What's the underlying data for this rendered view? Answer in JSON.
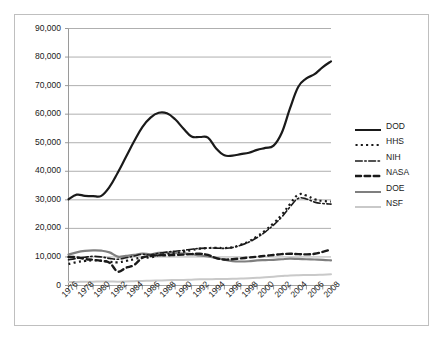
{
  "chart_data": {
    "type": "line",
    "title": "",
    "xlabel": "",
    "ylabel": "",
    "ylim": [
      0,
      90000
    ],
    "xlim": [
      1976,
      2008
    ],
    "grid": true,
    "legend_position": "right",
    "y_ticks": [
      "0",
      "10,000",
      "20,000",
      "30,000",
      "40,000",
      "50,000",
      "60,000",
      "70,000",
      "80,000",
      "90,000"
    ],
    "y_tick_values": [
      0,
      10000,
      20000,
      30000,
      40000,
      50000,
      60000,
      70000,
      80000,
      90000
    ],
    "x_tick_labels": [
      "1976",
      "1978",
      "1980",
      "1982",
      "1984",
      "1986",
      "1988",
      "1990",
      "1992",
      "1994",
      "1996",
      "1998",
      "2000",
      "2002",
      "2004",
      "2006",
      "2008"
    ],
    "x": [
      1976,
      1977,
      1978,
      1979,
      1980,
      1981,
      1982,
      1983,
      1984,
      1985,
      1986,
      1987,
      1988,
      1989,
      1990,
      1991,
      1992,
      1993,
      1994,
      1995,
      1996,
      1997,
      1998,
      1999,
      2000,
      2001,
      2002,
      2003,
      2004,
      2005,
      2006,
      2007,
      2008
    ],
    "series": [
      {
        "name": "DOD",
        "style": "solid",
        "color": "#1a1a1a",
        "width": 2.2,
        "values": [
          30200,
          31800,
          31400,
          31300,
          31400,
          34500,
          39500,
          45000,
          50500,
          55500,
          58800,
          60500,
          60300,
          58200,
          55000,
          52200,
          52000,
          51800,
          48000,
          45600,
          45500,
          46000,
          46500,
          47500,
          48200,
          49000,
          53500,
          62000,
          69500,
          72500,
          74000,
          76500,
          78500
        ]
      },
      {
        "name": "HHS",
        "style": "dotted",
        "color": "#1a1a1a",
        "width": 2.2,
        "values": [
          7500,
          8200,
          8600,
          8800,
          8700,
          8300,
          8100,
          8600,
          9200,
          9900,
          9800,
          10600,
          11000,
          11400,
          11800,
          12400,
          12900,
          13100,
          13200,
          13100,
          13400,
          14300,
          15500,
          17200,
          19300,
          21800,
          24800,
          28500,
          31800,
          31500,
          30200,
          29600,
          29400
        ]
      },
      {
        "name": "NIH",
        "style": "dashdot",
        "color": "#1a1a1a",
        "width": 1.6,
        "values": [
          9000,
          9500,
          9900,
          10200,
          10000,
          9500,
          9200,
          9700,
          10300,
          10900,
          10700,
          11300,
          11700,
          12000,
          12300,
          12700,
          13000,
          13100,
          13100,
          13000,
          13300,
          14100,
          15200,
          16800,
          18800,
          21200,
          24000,
          27500,
          30500,
          30300,
          29200,
          28700,
          28500
        ]
      },
      {
        "name": "NASA",
        "style": "dashed",
        "color": "#1a1a1a",
        "width": 2.4,
        "values": [
          10000,
          9900,
          9300,
          9000,
          8600,
          8000,
          4900,
          6200,
          7200,
          9700,
          10300,
          10600,
          10600,
          10700,
          10800,
          11000,
          11100,
          10700,
          9600,
          9100,
          9200,
          9500,
          9800,
          10100,
          10400,
          10700,
          11000,
          11100,
          11000,
          10900,
          11100,
          11800,
          12600
        ]
      },
      {
        "name": "DOE",
        "style": "solid",
        "color": "#7f7f7f",
        "width": 2.2,
        "values": [
          10800,
          11600,
          12100,
          12300,
          12200,
          11600,
          10100,
          10400,
          10700,
          11200,
          10900,
          11400,
          11500,
          11400,
          11200,
          11000,
          10500,
          10200,
          9700,
          9000,
          8500,
          8400,
          8500,
          8800,
          8900,
          9000,
          9200,
          9400,
          9300,
          9200,
          9100,
          9000,
          8800
        ]
      },
      {
        "name": "NSF",
        "style": "solid",
        "color": "#c9c9c9",
        "width": 2.0,
        "values": [
          1200,
          1250,
          1300,
          1350,
          1400,
          1400,
          1350,
          1400,
          1500,
          1600,
          1650,
          1750,
          1850,
          1900,
          1950,
          2050,
          2150,
          2200,
          2250,
          2300,
          2350,
          2450,
          2550,
          2700,
          2900,
          3100,
          3300,
          3500,
          3600,
          3650,
          3700,
          3800,
          3900
        ]
      }
    ]
  },
  "legend": {
    "items": [
      {
        "label": "DOD"
      },
      {
        "label": "HHS"
      },
      {
        "label": "NIH"
      },
      {
        "label": "NASA"
      },
      {
        "label": "DOE"
      },
      {
        "label": "NSF"
      }
    ]
  }
}
